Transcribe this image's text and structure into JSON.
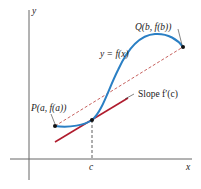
{
  "diagram": {
    "axes": {
      "x_label": "x",
      "y_label": "y",
      "c_label": "c"
    },
    "curve": {
      "label": "y = f(x)",
      "color": "#2a7fc4"
    },
    "points": {
      "P": {
        "label": "P(a, f(a))"
      },
      "Q": {
        "label": "Q(b, f(b))"
      }
    },
    "secant": {
      "color": "#c0504d",
      "style": "dashed"
    },
    "tangent": {
      "label": "Slope f′(c)",
      "color": "#b01c2e"
    },
    "colors": {
      "axis": "#555555",
      "text": "#222222"
    }
  }
}
